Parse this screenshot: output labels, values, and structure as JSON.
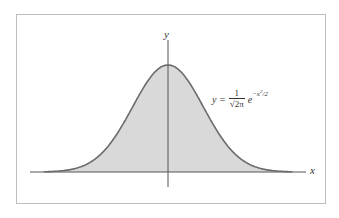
{
  "chart_data": {
    "type": "area",
    "title": "",
    "xlabel": "x",
    "ylabel": "y",
    "annotation": "y = (1/√(2π)) e^(−x²/2)",
    "function": "standard normal density",
    "x": [
      -3.5,
      -3,
      -2.5,
      -2,
      -1.5,
      -1,
      -0.5,
      0,
      0.5,
      1,
      1.5,
      2,
      2.5,
      3,
      3.5
    ],
    "values": [
      0.0009,
      0.0044,
      0.0175,
      0.054,
      0.1295,
      0.242,
      0.3521,
      0.3989,
      0.3521,
      0.242,
      0.1295,
      0.054,
      0.0175,
      0.0044,
      0.0009
    ],
    "fill_color": "#d9d9d9",
    "line_color": "#6b6b6b",
    "grid": false,
    "legend": "none"
  },
  "labels": {
    "x_axis": "x",
    "y_axis": "y",
    "formula_lhs": "y =",
    "formula_num": "1",
    "formula_den": "√2π",
    "formula_exp_base": "e",
    "formula_exp": "−x",
    "formula_exp_sq": "2",
    "formula_exp_tail": "/2"
  }
}
